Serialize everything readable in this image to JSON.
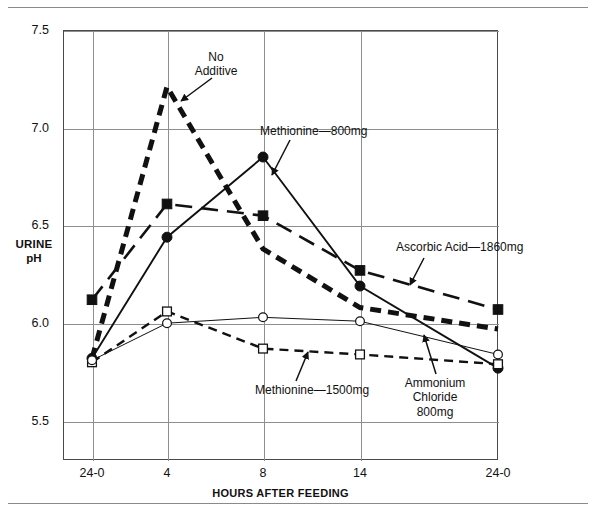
{
  "figure": {
    "frame": {
      "top_rule": true,
      "bottom_rule": true
    }
  },
  "axes": {
    "y_label_line1": "URINE",
    "y_label_line2": "pH",
    "x_label": "HOURS AFTER FEEDING",
    "y_ticks": [
      "7.5",
      "7.0",
      "6.5",
      "6.0",
      "5.5"
    ],
    "x_ticks": [
      "24-0",
      "4",
      "8",
      "14",
      "24-0"
    ]
  },
  "annotations": [
    {
      "name": "no-additive",
      "text": "No\nAdditive"
    },
    {
      "name": "methionine-800",
      "text": "Methionine—800mg"
    },
    {
      "name": "ascorbic-acid-1860",
      "text": "Ascorbic Acid—1860mg"
    },
    {
      "name": "methionine-1500",
      "text": "Methionine—1500mg"
    },
    {
      "name": "ammonium-chloride",
      "text": "Ammonium\nChloride\n800mg"
    }
  ],
  "chart_data": {
    "type": "line",
    "title": "",
    "xlabel": "HOURS AFTER FEEDING",
    "ylabel": "URINE pH",
    "categories": [
      "24-0",
      "4",
      "8",
      "14",
      "24-0"
    ],
    "ylim": [
      5.3,
      7.5
    ],
    "yticks": [
      5.5,
      6.0,
      6.5,
      7.0,
      7.5
    ],
    "grid": true,
    "legend": "inline-annotations",
    "series": [
      {
        "name": "No Additive",
        "values": [
          5.82,
          7.21,
          6.38,
          6.08,
          5.97
        ],
        "marker": "none",
        "style": "thick-dash",
        "color": "#111111"
      },
      {
        "name": "Methionine—800mg",
        "values": [
          5.82,
          6.44,
          6.85,
          6.19,
          5.77
        ],
        "marker": "filled-circle",
        "style": "solid-thin",
        "color": "#111111"
      },
      {
        "name": "Ascorbic Acid—1860mg",
        "values": [
          6.12,
          6.61,
          6.55,
          6.27,
          6.07
        ],
        "marker": "filled-square",
        "style": "long-dash",
        "color": "#111111"
      },
      {
        "name": "Methionine—1500mg",
        "values": [
          5.8,
          6.06,
          5.87,
          5.84,
          5.79
        ],
        "marker": "open-square",
        "style": "medium-dash",
        "color": "#111111"
      },
      {
        "name": "Ammonium Chloride 800mg",
        "values": [
          5.81,
          6.0,
          6.03,
          6.01,
          5.84
        ],
        "marker": "open-circle",
        "style": "solid-hairline",
        "color": "#111111"
      }
    ]
  }
}
